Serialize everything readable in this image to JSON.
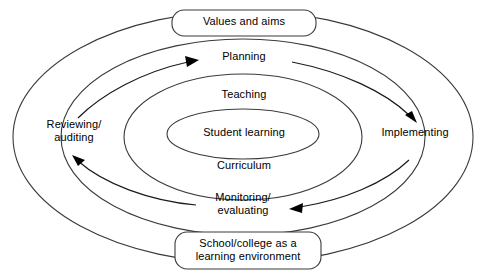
{
  "diagram": {
    "type": "concentric-ellipse-cycle",
    "colors": {
      "background": "#ffffff",
      "ring_stroke": "#3b3b3b",
      "arc_stroke": "#1a1a1a",
      "arrow_fill": "#000000",
      "text": "#000000"
    },
    "boxes": [
      {
        "id": "values-and-aims",
        "label": "Values and aims",
        "position": "top"
      },
      {
        "id": "school-college",
        "label": "School/college as a\nlearning environment",
        "position": "bottom"
      }
    ],
    "cycle_stages": [
      {
        "id": "planning",
        "label": "Planning",
        "position": "top"
      },
      {
        "id": "implementing",
        "label": "Implementing",
        "position": "right"
      },
      {
        "id": "monitoring",
        "label": "Monitoring/\nevaluating",
        "position": "bottom"
      },
      {
        "id": "reviewing",
        "label": "Reviewing/\nauditing",
        "position": "left"
      }
    ],
    "core_layers": [
      {
        "id": "teaching",
        "label": "Teaching",
        "ring": 3,
        "position": "upper"
      },
      {
        "id": "student",
        "label": "Student learning",
        "ring": 4,
        "position": "centre"
      },
      {
        "id": "curriculum",
        "label": "Curriculum",
        "ring": 3,
        "position": "lower"
      }
    ],
    "rings": [
      {
        "id": "ring-outer",
        "rx": 228,
        "ry": 125
      },
      {
        "id": "ring-second",
        "rx": 180,
        "ry": 97
      },
      {
        "id": "ring-third",
        "rx": 118,
        "ry": 62
      },
      {
        "id": "ring-core",
        "rx": 76,
        "ry": 25
      }
    ],
    "arrows": [
      {
        "id": "arrow-to-planning",
        "direction": "right",
        "target": "planning"
      },
      {
        "id": "arrow-to-implementing",
        "direction": "down-right",
        "target": "implementing"
      },
      {
        "id": "arrow-to-monitoring",
        "direction": "left",
        "target": "monitoring"
      },
      {
        "id": "arrow-to-reviewing",
        "direction": "up-left",
        "target": "reviewing"
      }
    ]
  }
}
